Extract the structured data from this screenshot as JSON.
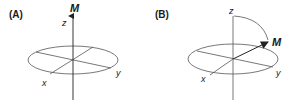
{
  "panels": [
    {
      "label": "(A)",
      "axes": {
        "x": "x",
        "y": "y",
        "z": "z"
      },
      "vector": "M",
      "description": "Magnetization vector M aligned along z axis"
    },
    {
      "label": "(B)",
      "axes": {
        "x": "x",
        "y": "y",
        "z": "z"
      },
      "vector": "M",
      "description": "Magnetization vector M tipped from z axis toward the x-y plane"
    }
  ],
  "colors": {
    "line": "#3a3a3a",
    "text": "#1a1a1a",
    "background": "#ffffff"
  }
}
